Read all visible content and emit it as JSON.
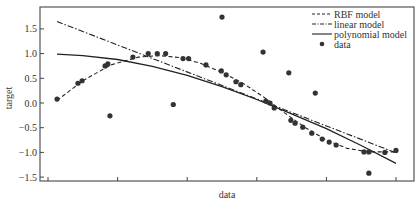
{
  "chart_data": {
    "type": "scatter",
    "title": "",
    "xlabel": "data",
    "ylabel": "target",
    "xlim": [
      -0.12,
      5.25
    ],
    "ylim": [
      -1.6,
      1.95
    ],
    "xticks": [
      0,
      1,
      2,
      3,
      4,
      5
    ],
    "xtick_labels": [
      "",
      "",
      "",
      "",
      "",
      ""
    ],
    "yticks": [
      1.5,
      1.0,
      0.5,
      0.0,
      -0.5,
      -1.0,
      -1.5
    ],
    "ytick_labels": [
      "1.5",
      "1.0",
      "0.5",
      "0.0",
      "−0.5",
      "−1.0",
      "−1.5"
    ],
    "grid": false,
    "legend_position": "upper right",
    "legend": [
      "RBF model",
      "linear model",
      "polynomial model",
      "data"
    ],
    "series": [
      {
        "name": "RBF model",
        "kind": "line",
        "style": "dashed",
        "x": [
          0.13,
          0.5,
          0.9,
          1.3,
          1.6,
          1.9,
          2.2,
          2.5,
          2.8,
          3.1,
          3.4,
          3.7,
          4.0,
          4.3,
          4.6,
          5.0
        ],
        "y": [
          0.05,
          0.45,
          0.77,
          0.93,
          0.96,
          0.92,
          0.8,
          0.62,
          0.4,
          0.12,
          -0.2,
          -0.5,
          -0.75,
          -0.92,
          -0.99,
          -0.99
        ]
      },
      {
        "name": "linear model",
        "kind": "line",
        "style": "dashdot",
        "x": [
          0.13,
          5.0
        ],
        "y": [
          1.65,
          -1.01
        ]
      },
      {
        "name": "polynomial model",
        "kind": "line",
        "style": "solid",
        "x": [
          0.13,
          0.5,
          1.0,
          1.5,
          2.0,
          2.5,
          3.0,
          3.5,
          4.0,
          4.5,
          5.0
        ],
        "y": [
          0.99,
          0.96,
          0.88,
          0.74,
          0.56,
          0.33,
          0.07,
          -0.22,
          -0.52,
          -0.86,
          -1.22
        ]
      },
      {
        "name": "data",
        "kind": "scatter",
        "x": [
          0.13,
          0.43,
          0.49,
          0.82,
          0.86,
          0.89,
          1.22,
          1.44,
          1.57,
          1.69,
          1.8,
          1.94,
          2.02,
          2.27,
          2.49,
          2.5,
          2.56,
          2.7,
          2.77,
          3.09,
          3.13,
          3.19,
          3.25,
          3.46,
          3.49,
          3.55,
          3.66,
          3.79,
          3.84,
          3.94,
          4.04,
          4.14,
          4.54,
          4.61,
          4.61,
          4.84,
          5.0
        ],
        "y": [
          0.08,
          0.4,
          0.45,
          0.75,
          0.79,
          -0.26,
          0.93,
          1.0,
          1.0,
          1.0,
          -0.03,
          0.9,
          0.9,
          0.77,
          0.65,
          1.74,
          0.57,
          0.43,
          0.37,
          1.03,
          0.04,
          0.0,
          -0.1,
          0.61,
          -0.35,
          -0.41,
          -0.49,
          -0.61,
          0.2,
          -0.73,
          -0.79,
          -0.85,
          -0.99,
          -0.99,
          -1.42,
          -1.0,
          -0.96
        ]
      }
    ]
  },
  "colors": {
    "axis": "#444444",
    "lines": "#222222",
    "points": "#333333",
    "text": "#333333"
  }
}
